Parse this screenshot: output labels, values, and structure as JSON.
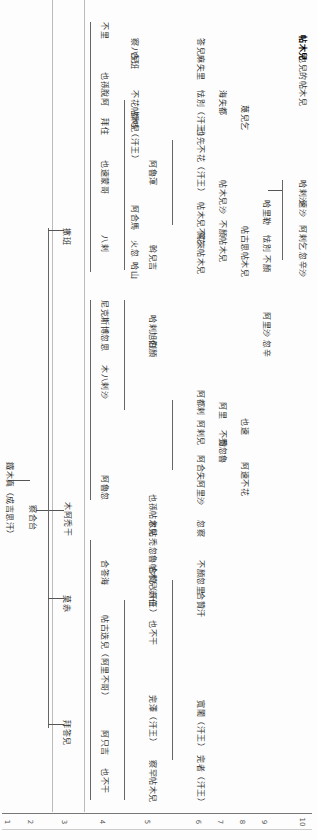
{
  "document": {
    "type": "genealogical-tree",
    "orientation": "rotated-90",
    "root": {
      "label": "鐵木真（成吉思汗）"
    },
    "gen2": {
      "label": "察合台"
    },
    "gen3": [
      {
        "label": "拜答兒"
      },
      {
        "label": "木阿禿干"
      },
      {
        "label": "哈剌旭烈"
      },
      {
        "label": "莫赤"
      },
      {
        "label": "撒班"
      }
    ],
    "nodes": [
      {
        "id": "n_root",
        "label": "鐵木真（成吉思汗）",
        "x": 5,
        "y": 462
      },
      {
        "id": "n_chag",
        "label": "察合台",
        "x": 28,
        "y": 505
      },
      {
        "id": "n_muatukan",
        "label": "木阿禿干",
        "x": 63,
        "y": 502
      },
      {
        "id": "n_sarban",
        "label": "撒班",
        "x": 62,
        "y": 228
      },
      {
        "id": "n_moci",
        "label": "莫赤",
        "x": 62,
        "y": 595
      },
      {
        "id": "n_baidar",
        "label": "拜答兒",
        "x": 62,
        "y": 720
      },
      {
        "id": "n_buri",
        "label": "不里",
        "x": 100,
        "y": 22
      },
      {
        "id": "n_kilchi",
        "label": "也孫脫阿",
        "x": 100,
        "y": 72
      },
      {
        "id": "n_kuria",
        "label": "拜住",
        "x": 100,
        "y": 118
      },
      {
        "id": "n_yesu",
        "label": "也速蒙哥",
        "x": 100,
        "y": 160
      },
      {
        "id": "n_bayan",
        "label": "八剌",
        "x": 100,
        "y": 235
      },
      {
        "id": "n_nikude",
        "label": "尼克斯博忽思",
        "x": 100,
        "y": 300
      },
      {
        "id": "n_mobiar",
        "label": "木八剌沙",
        "x": 100,
        "y": 365
      },
      {
        "id": "n_alghu",
        "label": "阿魯忽",
        "x": 100,
        "y": 475
      },
      {
        "id": "n_khadai",
        "label": "合答海",
        "x": 100,
        "y": 560
      },
      {
        "id": "n_tekuder",
        "label": "帖古迭兒（阿里不哥）",
        "x": 100,
        "y": 615
      },
      {
        "id": "n_kuchuk",
        "label": "阿只吉",
        "x": 100,
        "y": 730
      },
      {
        "id": "n_ailbr",
        "label": "也不干",
        "x": 100,
        "y": 768
      },
      {
        "id": "n_hasan",
        "label": "哈山",
        "x": 130,
        "y": 262
      },
      {
        "id": "n_hulegu",
        "label": "火忽",
        "x": 130,
        "y": 240
      },
      {
        "id": "n_ahmad",
        "label": "阿合馬",
        "x": 130,
        "y": 205
      },
      {
        "id": "n_du",
        "label": "都哇（汗王）",
        "x": 130,
        "y": 112
      },
      {
        "id": "n_buqa",
        "label": "不花帖木兒",
        "x": 130,
        "y": 90
      },
      {
        "id": "n_kabak",
        "label": "合班",
        "x": 130,
        "y": 52
      },
      {
        "id": "n_chapar",
        "label": "察八兒",
        "x": 130,
        "y": 38
      },
      {
        "id": "n_buyan",
        "label": "伯顏",
        "x": 148,
        "y": 340
      },
      {
        "id": "n_khara",
        "label": "哈剌旭烈",
        "x": 148,
        "y": 315
      },
      {
        "id": "n_orgh",
        "label": "斡兒吉",
        "x": 148,
        "y": 245
      },
      {
        "id": "n_alghu2",
        "label": "阿魯渾",
        "x": 148,
        "y": 160
      },
      {
        "id": "n_ebugen",
        "label": "也不干",
        "x": 148,
        "y": 620
      },
      {
        "id": "n_chibi",
        "label": "赤伯",
        "x": 148,
        "y": 590
      },
      {
        "id": "n_kazan",
        "label": "合贊（汗王）",
        "x": 148,
        "y": 566
      },
      {
        "id": "n_tuqa",
        "label": "禿忽魯帖木兒",
        "x": 148,
        "y": 538
      },
      {
        "id": "n_kusi",
        "label": "忽帖",
        "x": 148,
        "y": 520
      },
      {
        "id": "n_biljig",
        "label": "也孫帖木兒",
        "x": 148,
        "y": 494
      },
      {
        "id": "n_ong",
        "label": "完澤（汗王）",
        "x": 148,
        "y": 695
      },
      {
        "id": "n_ilak",
        "label": "察罕帖木兒",
        "x": 148,
        "y": 760
      },
      {
        "id": "n_yesun",
        "label": "也先不花（汗王）",
        "x": 196,
        "y": 128
      },
      {
        "id": "n_esen",
        "label": "怯別（汗王）",
        "x": 196,
        "y": 90
      },
      {
        "id": "n_kebek",
        "label": "答兒麻失里",
        "x": 196,
        "y": 38
      },
      {
        "id": "n_duwa2",
        "label": "篤來帖木兒",
        "x": 196,
        "y": 232
      },
      {
        "id": "n_tarmashirin",
        "label": "帖木兒不花",
        "x": 196,
        "y": 202
      },
      {
        "id": "n_hasan2",
        "label": "合贊汗",
        "x": 196,
        "y": 592
      },
      {
        "id": "n_bayan2",
        "label": "不顏忽里",
        "x": 196,
        "y": 560
      },
      {
        "id": "n_kuchi",
        "label": "忽察",
        "x": 196,
        "y": 520
      },
      {
        "id": "n_ketaitmur",
        "label": "寬闍（汗王）",
        "x": 196,
        "y": 700
      },
      {
        "id": "n_hasan3",
        "label": "完者（汗王）",
        "x": 196,
        "y": 755
      },
      {
        "id": "n_darm",
        "label": "阿都剌",
        "x": 196,
        "y": 390
      },
      {
        "id": "n_arazi",
        "label": "阿剌兒",
        "x": 196,
        "y": 420
      },
      {
        "id": "n_buyinkuli",
        "label": "阿合失",
        "x": 196,
        "y": 455
      },
      {
        "id": "n_atoqa",
        "label": "阿里沙",
        "x": 196,
        "y": 480
      },
      {
        "id": "n_kazan2",
        "label": "海失都",
        "x": 218,
        "y": 90
      },
      {
        "id": "n_tokhtemur",
        "label": "不顏帖木兒",
        "x": 218,
        "y": 220
      },
      {
        "id": "n_temurbuqa",
        "label": "帖木兒沙",
        "x": 218,
        "y": 180
      },
      {
        "id": "n_tugh",
        "label": "禿忽魯",
        "x": 218,
        "y": 438
      },
      {
        "id": "n_buzan",
        "label": "不贊",
        "x": 218,
        "y": 430
      },
      {
        "id": "n_ali",
        "label": "阿里",
        "x": 218,
        "y": 402
      },
      {
        "id": "n_mubarakshah",
        "label": "蔑兒乞",
        "x": 240,
        "y": 105
      },
      {
        "id": "n_baraq2",
        "label": "帖古思帖木兒",
        "x": 240,
        "y": 226
      },
      {
        "id": "n_tugh2",
        "label": "阿速不花",
        "x": 240,
        "y": 462
      },
      {
        "id": "n_amir",
        "label": "也速",
        "x": 240,
        "y": 418
      },
      {
        "id": "n_khalil",
        "label": "哈里勒",
        "x": 262,
        "y": 200
      },
      {
        "id": "n_kazan3",
        "label": "怯別",
        "x": 262,
        "y": 235
      },
      {
        "id": "n_buyan3",
        "label": "不顏",
        "x": 262,
        "y": 255
      },
      {
        "id": "n_sanj",
        "label": "阿里沙",
        "x": 262,
        "y": 312
      },
      {
        "id": "n_shah",
        "label": "忽辛",
        "x": 262,
        "y": 340
      },
      {
        "id": "n_tokhtamish",
        "label": "忽辛沙",
        "x": 298,
        "y": 252
      },
      {
        "id": "n_tgmsh",
        "label": "阿剌乞",
        "x": 298,
        "y": 225
      },
      {
        "id": "n_aliy",
        "label": "速沙",
        "x": 298,
        "y": 200
      },
      {
        "id": "n_hs",
        "label": "哈剌沙",
        "x": 298,
        "y": 180
      },
      {
        "id": "n_iltimur",
        "label": "也兒的帖木兒",
        "x": 298,
        "y": 55
      },
      {
        "id": "n_kb",
        "label": "帖木兒",
        "x": 298,
        "y": 35
      }
    ],
    "generation_ruler": {
      "labels": [
        "1",
        "2",
        "3",
        "4",
        "5",
        "6",
        "7",
        "8",
        "9",
        "10"
      ],
      "x": [
        5,
        28,
        62,
        100,
        145,
        196,
        218,
        240,
        262,
        298
      ]
    }
  }
}
